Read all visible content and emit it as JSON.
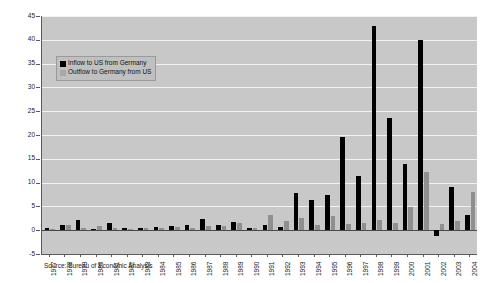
{
  "chart_data": {
    "type": "bar",
    "title": "",
    "subtitle": "",
    "xlabel": "",
    "ylabel": "",
    "ylim": [
      -5,
      45
    ],
    "ytick_step": 5,
    "yticks": [
      45,
      40,
      35,
      30,
      25,
      20,
      15,
      10,
      5,
      0,
      -5
    ],
    "grid": true,
    "legend_position": "upper-left-inside",
    "categories": [
      "1977",
      "1978",
      "1979",
      "1980",
      "1981",
      "1982",
      "1983",
      "1984",
      "1985",
      "1986",
      "1987",
      "1988",
      "1989",
      "1990",
      "1991",
      "1992",
      "1993",
      "1994",
      "1995",
      "1996",
      "1997",
      "1998",
      "1999",
      "2000",
      "2001",
      "2002",
      "2003",
      "2004"
    ],
    "series": [
      {
        "name": "Inflow to US from Germany",
        "color": "#000000",
        "values": [
          0.5,
          1.1,
          2.1,
          0.3,
          1.6,
          0.4,
          0.5,
          0.7,
          0.8,
          1.0,
          2.3,
          1.2,
          1.7,
          0.5,
          1.1,
          0.7,
          7.8,
          6.3,
          7.3,
          19.5,
          11.3,
          43.0,
          23.5,
          14.0,
          40.0,
          -1.2,
          9.0,
          3.2
        ]
      },
      {
        "name": "Outflow to Germany from US",
        "color": "#8f8f8f",
        "values": [
          0.2,
          1.0,
          0.5,
          0.9,
          0.4,
          0.3,
          0.4,
          0.4,
          0.6,
          0.5,
          0.9,
          0.8,
          1.6,
          0.5,
          3.1,
          2.0,
          2.5,
          1.0,
          3.0,
          1.4,
          1.5,
          2.1,
          1.5,
          4.9,
          12.3,
          1.3,
          1.9,
          8.1
        ]
      }
    ]
  },
  "legend": {
    "items": [
      {
        "label": "Inflow to US from Germany"
      },
      {
        "label": "Outflow to Germany from US"
      }
    ]
  },
  "source": {
    "text": "Source: Bureau of Economic Analysis"
  },
  "colors": {
    "inflow": "#000000",
    "outflow": "#8f8f8f",
    "plot_background": "#c8c8c8",
    "gridline": "#f2f2f2",
    "axis": "#5a5a5a",
    "page_background": "#ffffff"
  }
}
